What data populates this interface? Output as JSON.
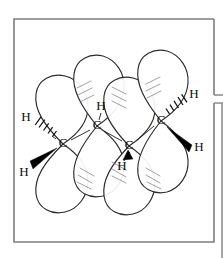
{
  "figure": {
    "frame_color": "#7d7d7d",
    "lobe_stroke_color": "#2b2b2b",
    "bond_color": "#1a1a1a"
  },
  "atoms": [
    {
      "id": "c1",
      "label": "C",
      "x": 63,
      "y": 144
    },
    {
      "id": "c2",
      "label": "C",
      "x": 97,
      "y": 126
    },
    {
      "id": "c3",
      "label": "C",
      "x": 129,
      "y": 146
    },
    {
      "id": "c4",
      "label": "C",
      "x": 161,
      "y": 121
    }
  ],
  "hydrogens": [
    {
      "id": "h1",
      "label": "H",
      "x": 26,
      "y": 118,
      "bond": "hash",
      "attached_to": "c1"
    },
    {
      "id": "h2",
      "label": "H",
      "x": 24,
      "y": 173,
      "bond": "wedge",
      "attached_to": "c1"
    },
    {
      "id": "h3",
      "label": "H",
      "x": 101,
      "y": 108,
      "bond": "plain",
      "attached_to": "c2"
    },
    {
      "id": "h4",
      "label": "H",
      "x": 123,
      "y": 165,
      "bond": "wedge",
      "attached_to": "c3"
    },
    {
      "id": "h5",
      "label": "H",
      "x": 194,
      "y": 96,
      "bond": "hash",
      "attached_to": "c4"
    },
    {
      "id": "h6",
      "label": "H",
      "x": 199,
      "y": 148,
      "bond": "wedge",
      "attached_to": "c4"
    }
  ],
  "orbital_lobes": {
    "count": 8,
    "upper": [
      {
        "cx": 61,
        "tip_x": 63,
        "tip_y": 144,
        "top_y": 75
      },
      {
        "cx": 96,
        "tip_x": 97,
        "tip_y": 126,
        "top_y": 62
      },
      {
        "cx": 128,
        "tip_x": 129,
        "tip_y": 146,
        "top_y": 80
      },
      {
        "cx": 160,
        "tip_x": 161,
        "tip_y": 121,
        "top_y": 60
      }
    ],
    "lower": [
      {
        "cx": 61,
        "tip_x": 63,
        "tip_y": 144,
        "bottom_y": 212
      },
      {
        "cx": 96,
        "tip_x": 97,
        "tip_y": 126,
        "bottom_y": 196
      },
      {
        "cx": 128,
        "tip_x": 129,
        "tip_y": 146,
        "bottom_y": 214
      },
      {
        "cx": 160,
        "tip_x": 161,
        "tip_y": 121,
        "bottom_y": 192
      }
    ]
  },
  "frame": {
    "left": 14,
    "top": 19,
    "right": 214,
    "bottom": 242,
    "notch_top_y": 95,
    "notch_bottom_y": 103,
    "image_right": 223
  }
}
